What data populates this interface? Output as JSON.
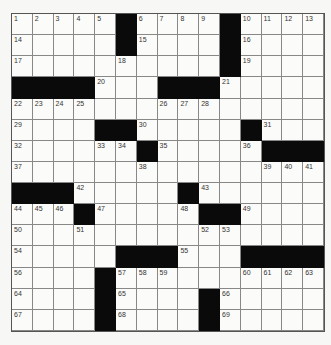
{
  "puzzle": {
    "rows": 15,
    "cols": 15,
    "colors": {
      "black_square": "#0a0a0a",
      "white_square": "#fbfbf9",
      "grid_line": "#888888"
    },
    "grid": [
      [
        "1",
        "2",
        "3",
        "4",
        "5",
        "#",
        "6",
        "7",
        "8",
        "9",
        "#",
        "10",
        "11",
        "12",
        "13"
      ],
      [
        "14",
        "",
        "",
        "",
        "",
        "#",
        "15",
        "",
        "",
        "",
        "#",
        "16",
        "",
        "",
        ""
      ],
      [
        "17",
        "",
        "",
        "",
        "",
        "18",
        "",
        "",
        "",
        "",
        "#",
        "19",
        "",
        "",
        ""
      ],
      [
        "#",
        "#",
        "#",
        "#",
        "20",
        "",
        "",
        "#",
        "#",
        "#",
        "21",
        "",
        "",
        "",
        ""
      ],
      [
        "22",
        "23",
        "24",
        "25",
        "",
        "",
        "",
        "26",
        "27",
        "28",
        "",
        "",
        "",
        "",
        ""
      ],
      [
        "29",
        "",
        "",
        "",
        "#",
        "#",
        "30",
        "",
        "",
        "",
        "",
        "#",
        "31",
        "",
        ""
      ],
      [
        "32",
        "",
        "",
        "",
        "33",
        "34",
        "#",
        "35",
        "",
        "",
        "",
        "36",
        "#",
        "#",
        "#"
      ],
      [
        "37",
        "",
        "",
        "",
        "",
        "",
        "38",
        "",
        "",
        "",
        "",
        "",
        "39",
        "40",
        "41"
      ],
      [
        "#",
        "#",
        "#",
        "42",
        "",
        "",
        "",
        "",
        "#",
        "43",
        "",
        "",
        "",
        "",
        ""
      ],
      [
        "44",
        "45",
        "46",
        "#",
        "47",
        "",
        "",
        "",
        "48",
        "#",
        "#",
        "49",
        "",
        "",
        ""
      ],
      [
        "50",
        "",
        "",
        "51",
        "",
        "",
        "",
        "",
        "",
        "52",
        "53",
        "",
        "",
        "",
        ""
      ],
      [
        "54",
        "",
        "",
        "",
        "",
        "#",
        "#",
        "#",
        "55",
        "",
        "",
        "#",
        "#",
        "#",
        "#"
      ],
      [
        "56",
        "",
        "",
        "",
        "#",
        "57",
        "58",
        "59",
        "",
        "",
        "",
        "60",
        "61",
        "62",
        "63"
      ],
      [
        "64",
        "",
        "",
        "",
        "#",
        "65",
        "",
        "",
        "",
        "#",
        "66",
        "",
        "",
        "",
        ""
      ],
      [
        "67",
        "",
        "",
        "",
        "#",
        "68",
        "",
        "",
        "",
        "#",
        "69",
        "",
        "",
        "",
        ""
      ]
    ]
  }
}
